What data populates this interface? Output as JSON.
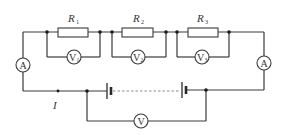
{
  "diagram": {
    "type": "circuit",
    "colors": {
      "wire": "#3a3a3a",
      "background": "#ffffff"
    },
    "resistors": [
      {
        "id": "R1",
        "label": "R",
        "sub": "1"
      },
      {
        "id": "R2",
        "label": "R",
        "sub": "2"
      },
      {
        "id": "R3",
        "label": "R",
        "sub": "3"
      }
    ],
    "voltmeters": [
      {
        "id": "V1",
        "label": "V",
        "sub": "1"
      },
      {
        "id": "V2",
        "label": "V",
        "sub": "2"
      },
      {
        "id": "V3",
        "label": "V",
        "sub": "3"
      },
      {
        "id": "V",
        "label": "V",
        "sub": ""
      }
    ],
    "ammeters": [
      {
        "id": "A-left",
        "label": "A"
      },
      {
        "id": "A-right",
        "label": "A"
      }
    ],
    "battery": {
      "label": "battery-pack",
      "cells": "multiple (dashed connection)"
    },
    "current_label": "I"
  }
}
